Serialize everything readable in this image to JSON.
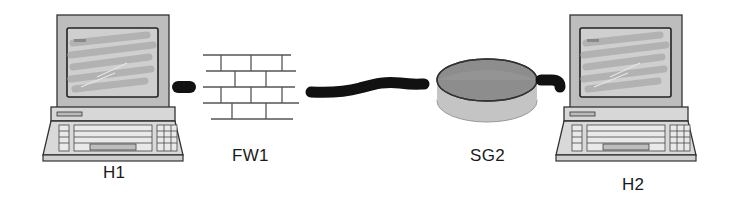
{
  "diagram": {
    "type": "network-topology",
    "nodes": [
      {
        "id": "H1",
        "label": "H1",
        "kind": "host-computer",
        "screen_text": "Search"
      },
      {
        "id": "FW1",
        "label": "FW1",
        "kind": "firewall"
      },
      {
        "id": "SG2",
        "label": "SG2",
        "kind": "security-gateway"
      },
      {
        "id": "H2",
        "label": "H2",
        "kind": "host-computer",
        "screen_text": "Search"
      }
    ],
    "edges": [
      {
        "from": "H1",
        "to": "FW1",
        "style": "short-thick-cable"
      },
      {
        "from": "FW1",
        "to": "SG2",
        "style": "wavy-thick-cable"
      },
      {
        "from": "SG2",
        "to": "H2",
        "style": "short-thick-cable"
      }
    ],
    "colors": {
      "cable": "#111111",
      "monitor_frame": "#bdbdbd",
      "screen": "#c8c8c8",
      "sg_top": "#8a8a8a",
      "sg_bottom": "#c4c4c4",
      "brick_line": "#555555"
    }
  }
}
